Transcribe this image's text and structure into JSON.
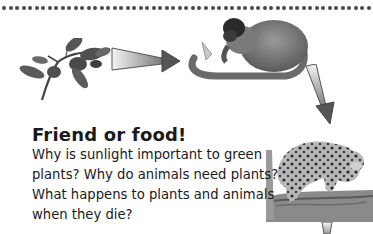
{
  "header": {
    "dot_count": 57,
    "dot_color": "#4a4a4a"
  },
  "illustrations": {
    "items": [
      {
        "name": "plant-branch",
        "description": "Green plant branch with leaves"
      },
      {
        "name": "monkey",
        "description": "Monkey eating"
      },
      {
        "name": "jaguar",
        "description": "Jaguar on tree branch"
      }
    ],
    "arrows": [
      {
        "from": "plant-branch",
        "to": "monkey"
      },
      {
        "from": "monkey",
        "to": "jaguar"
      },
      {
        "from": "jaguar",
        "to": "next"
      }
    ]
  },
  "section": {
    "title": "Friend or food!",
    "lines": [
      "Why is sunlight important to green",
      "plants? Why do animals need plants?",
      "What happens to plants and animals",
      "when they die?"
    ]
  }
}
